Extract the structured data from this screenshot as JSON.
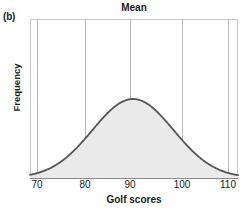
{
  "panel": {
    "label": "(b)"
  },
  "chart_data": {
    "type": "line",
    "title": "Mean",
    "xlabel": "Golf scores",
    "ylabel": "Frequency",
    "xlim": [
      66,
      114
    ],
    "ylim": [
      0,
      1.12
    ],
    "grid": true,
    "legend": false,
    "legend_position": "none",
    "xticks": [
      70,
      80,
      90,
      100,
      110
    ],
    "xtick_labels": [
      "70",
      "80",
      "90",
      "100",
      "110"
    ],
    "yticks": [],
    "ytick_labels": [],
    "annotations": [
      {
        "text": "Mean",
        "x": 90,
        "description": "Title label positioned above the center (mean) of the distribution"
      }
    ],
    "distribution": {
      "shape": "normal",
      "mean": 90,
      "std": 8.5,
      "peak_x": 90,
      "peak_y": 1.0,
      "filled": true
    },
    "x": [
      70,
      72,
      74,
      76,
      78,
      80,
      82,
      84,
      86,
      88,
      90,
      92,
      94,
      96,
      98,
      100,
      102,
      104,
      106,
      108,
      110
    ],
    "values": [
      0.01,
      0.03,
      0.06,
      0.11,
      0.19,
      0.29,
      0.42,
      0.56,
      0.72,
      0.87,
      1.0,
      0.87,
      0.72,
      0.56,
      0.42,
      0.29,
      0.19,
      0.11,
      0.06,
      0.03,
      0.01
    ],
    "series": [
      {
        "name": "Golf score frequency",
        "values": [
          0.01,
          0.03,
          0.06,
          0.11,
          0.19,
          0.29,
          0.42,
          0.56,
          0.72,
          0.87,
          1.0,
          0.87,
          0.72,
          0.56,
          0.42,
          0.29,
          0.19,
          0.11,
          0.06,
          0.03,
          0.01
        ]
      }
    ]
  },
  "colors": {
    "curve_stroke": "#555555",
    "curve_fill": "#eaeaea",
    "gridline": "#b9b9b9",
    "frame": "#c9c9c9",
    "text": "#1a1a1a",
    "background": "#ffffff"
  }
}
